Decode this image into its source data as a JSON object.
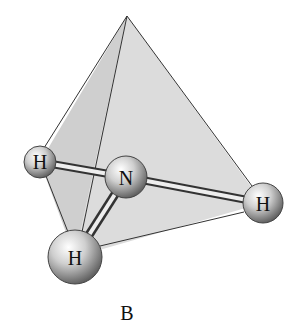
{
  "diagram": {
    "caption": "B",
    "apex": {
      "x": 127,
      "y": 16
    },
    "atoms": [
      {
        "id": "h-left",
        "label": "H",
        "x": 40,
        "y": 162,
        "r": 16
      },
      {
        "id": "n-center",
        "label": "N",
        "x": 126,
        "y": 177,
        "r": 21
      },
      {
        "id": "h-right",
        "label": "H",
        "x": 263,
        "y": 203,
        "r": 20
      },
      {
        "id": "h-bottom",
        "label": "H",
        "x": 75,
        "y": 257,
        "r": 27
      }
    ],
    "colors": {
      "face": "#d9d9d9",
      "face_dark": "#c4c4c4",
      "edge": "#333333",
      "atom_light": "#f4f4f4",
      "atom_dark": "#6e6e6e"
    }
  }
}
